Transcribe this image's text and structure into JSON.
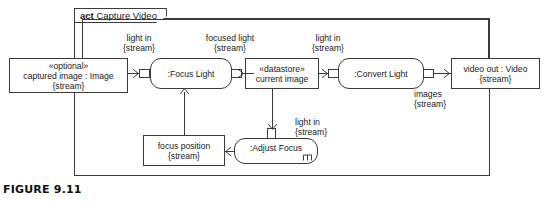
{
  "figure": {
    "caption": "FIGURE 9.11"
  },
  "frame": {
    "keyword": "act",
    "name": "Capture Video"
  },
  "nodes": {
    "captured_image": {
      "stereotype": "«optional»",
      "name": "captured image : Image",
      "rate": "{stream}"
    },
    "focus_light": {
      "name": ":Focus Light"
    },
    "datastore": {
      "stereotype": "«datastore»",
      "name": "current image"
    },
    "convert_light": {
      "name": ":Convert Light"
    },
    "video_out": {
      "name": "video out : Video",
      "rate": "{stream}"
    },
    "adjust_focus": {
      "name": ":Adjust Focus",
      "icon": "rake-icon"
    },
    "focus_position": {
      "name": "focus position",
      "rate": "{stream}"
    }
  },
  "edges": {
    "light_in_1": {
      "name": "light in",
      "rate": "{stream}"
    },
    "focused_light": {
      "name": "focused light",
      "rate": "{stream}"
    },
    "light_in_2": {
      "name": "light in",
      "rate": "{stream}"
    },
    "images": {
      "name": "images",
      "rate": "{stream}"
    },
    "light_in_3": {
      "name": "light in",
      "rate": "{stream}"
    }
  },
  "colors": {
    "line": "#3b3b3b",
    "text": "#1a1a1a",
    "background": "#ffffff"
  }
}
